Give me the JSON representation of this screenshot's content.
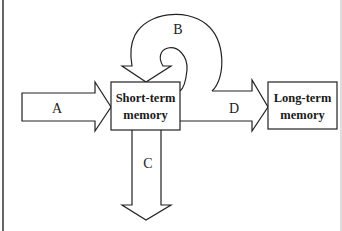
{
  "diagram": {
    "type": "memory-model-flow",
    "nodes": [
      {
        "id": "stm",
        "line1": "Short-term",
        "line2": "memory"
      },
      {
        "id": "ltm",
        "line1": "Long-term",
        "line2": "memory"
      }
    ],
    "arrows": [
      {
        "id": "A",
        "label": "A",
        "from": "input",
        "to": "stm"
      },
      {
        "id": "B",
        "label": "B",
        "from": "stm",
        "to": "stm"
      },
      {
        "id": "C",
        "label": "C",
        "from": "stm",
        "to": "output"
      },
      {
        "id": "D",
        "label": "D",
        "from": "stm",
        "to": "ltm"
      }
    ],
    "colors": {
      "stroke": "#222222",
      "fill": "#ffffff"
    }
  }
}
